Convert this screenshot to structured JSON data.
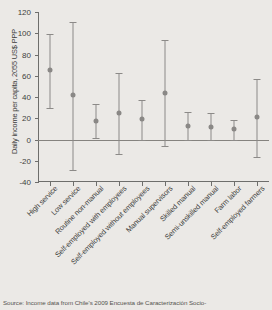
{
  "chart_data": {
    "type": "scatter",
    "title": "",
    "xlabel": "",
    "ylabel": "Daily income per capita, 2055 US$ PPP",
    "ylim": [
      -40,
      120
    ],
    "yticks": [
      -40,
      -20,
      0,
      20,
      40,
      60,
      80,
      100,
      120
    ],
    "ytick_labels": [
      "-40",
      "-20",
      "0",
      "20",
      "40",
      "60",
      "80",
      "100",
      "120"
    ],
    "grid": false,
    "legend": "none",
    "zero_reference_line": 0,
    "error_bar_style": "capped vertical confidence interval",
    "categories": [
      "High service",
      "Low service",
      "Routine non-manual",
      "Self-employed with employees",
      "Self-employed without employees",
      "Manual supervisors",
      "Skilled manual",
      "Semi-unskilled manual",
      "Farm labor",
      "Self-employed farmers"
    ],
    "values": [
      65,
      42,
      17,
      25,
      19,
      44,
      13,
      12,
      10,
      21
    ],
    "ci_low": [
      30,
      -29,
      1,
      -14,
      0,
      -6,
      0,
      0,
      0,
      -16
    ],
    "ci_high": [
      99,
      111,
      33,
      63,
      37,
      94,
      26,
      25,
      18,
      57
    ],
    "points": [
      {
        "category": "High service",
        "value": 65,
        "ci_low": 30,
        "ci_high": 99
      },
      {
        "category": "Low service",
        "value": 42,
        "ci_low": -29,
        "ci_high": 111
      },
      {
        "category": "Routine non-manual",
        "value": 17,
        "ci_low": 1,
        "ci_high": 33
      },
      {
        "category": "Self-employed with employees",
        "value": 25,
        "ci_low": -14,
        "ci_high": 63
      },
      {
        "category": "Self-employed without employees",
        "value": 19,
        "ci_low": 0,
        "ci_high": 37
      },
      {
        "category": "Manual supervisors",
        "value": 44,
        "ci_low": -6,
        "ci_high": 94
      },
      {
        "category": "Skilled manual",
        "value": 13,
        "ci_low": 0,
        "ci_high": 26
      },
      {
        "category": "Semi-unskilled manual",
        "value": 12,
        "ci_low": 0,
        "ci_high": 25
      },
      {
        "category": "Farm labor",
        "value": 10,
        "ci_low": 0,
        "ci_high": 18
      },
      {
        "category": "Self-employed farmers",
        "value": 21,
        "ci_low": -16,
        "ci_high": 57
      }
    ],
    "colors": {
      "background": "#ebe9e6",
      "marker": "#8a8886",
      "errorbar": "#8c8a88",
      "axis": "#6e6e6c",
      "text": "#3f3f3d"
    }
  },
  "source_note": "Source: Income data from Chile's 2009 Encuesta de Caracterización Socio-"
}
